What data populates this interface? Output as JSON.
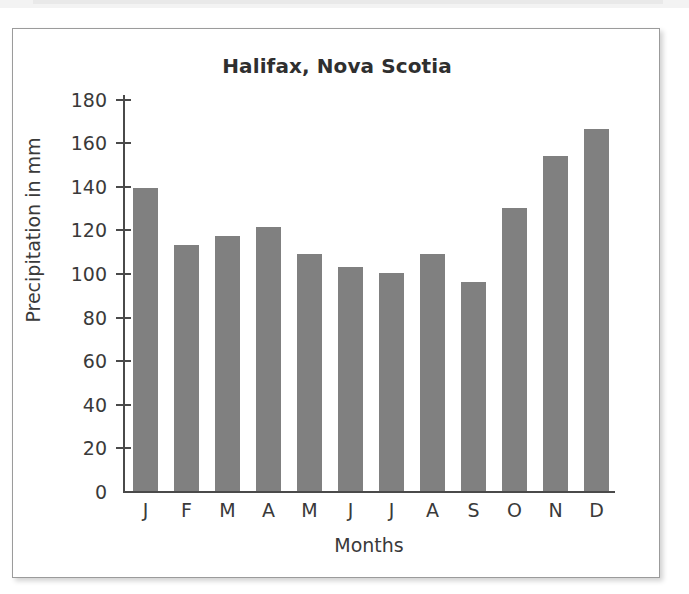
{
  "figure": {
    "background_color": "#ffffff",
    "border_color": "#9b9b9b",
    "bar_color": "#808080",
    "axis_color": "#4a4a4a",
    "text_color": "#3a3a3a"
  },
  "chart_data": {
    "type": "bar",
    "title": "Halifax, Nova Scotia",
    "xlabel": "Months",
    "ylabel": "Precipitation in mm",
    "categories": [
      "J",
      "F",
      "M",
      "A",
      "M",
      "J",
      "J",
      "A",
      "S",
      "O",
      "N",
      "D"
    ],
    "values": [
      139,
      113,
      117,
      121,
      109,
      103,
      100,
      109,
      96,
      130,
      154,
      166
    ],
    "ylim": [
      0,
      180
    ],
    "ytick_labels": [
      "180",
      "160",
      "140",
      "120",
      "100",
      "80",
      "60",
      "40",
      "20",
      "0"
    ],
    "yticks": [
      180,
      160,
      140,
      120,
      100,
      80,
      60,
      40,
      20,
      0
    ],
    "grid": false,
    "legend": null,
    "series": [
      {
        "name": "Precipitation in mm",
        "values": [
          139,
          113,
          117,
          121,
          109,
          103,
          100,
          109,
          96,
          130,
          154,
          166
        ]
      }
    ]
  }
}
